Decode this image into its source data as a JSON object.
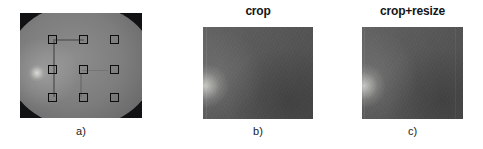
{
  "figure": {
    "background_color": "#ffffff",
    "width": 483,
    "height": 149,
    "panels": [
      {
        "id": "a",
        "title": "",
        "caption": "a)",
        "image_type": "retinal-fundus-photograph",
        "description": "grayscale retinal fundus image with 3x3 grid of square patch markers",
        "background_color": "#111214",
        "disc_color": "#7d7d7d",
        "marker_color": "#0d0d0d",
        "marker_count": 9,
        "marker_rows": 3,
        "marker_cols": 3
      },
      {
        "id": "b",
        "title": "crop",
        "caption": "b)",
        "image_type": "cropped-retina-patch",
        "description": "dark gray cropped retinal tissue patch",
        "patch_color": "#585858"
      },
      {
        "id": "c",
        "title": "crop+resize",
        "caption": "c)",
        "image_type": "cropped-resized-retina-patch",
        "description": "dark gray cropped and resized retinal tissue patch",
        "patch_color": "#585858"
      }
    ]
  },
  "markers": [
    {
      "label": "marker-r1c1",
      "x": 31,
      "y": 26
    },
    {
      "label": "marker-r1c2",
      "x": 62,
      "y": 26
    },
    {
      "label": "marker-r1c3",
      "x": 93,
      "y": 26
    },
    {
      "label": "marker-r2c1",
      "x": 31,
      "y": 56
    },
    {
      "label": "marker-r2c2",
      "x": 62,
      "y": 56
    },
    {
      "label": "marker-r2c3",
      "x": 93,
      "y": 56
    },
    {
      "label": "marker-r3c1",
      "x": 31,
      "y": 84
    },
    {
      "label": "marker-r3c2",
      "x": 62,
      "y": 84
    },
    {
      "label": "marker-r3c3",
      "x": 93,
      "y": 84
    }
  ]
}
